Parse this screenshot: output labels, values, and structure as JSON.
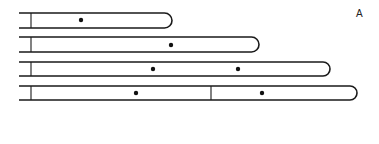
{
  "panel_label": "A",
  "colors": {
    "stroke": "#1a1a1a",
    "dot": "#111111",
    "background": "#ffffff"
  },
  "rods": [
    {
      "id": "rod-1",
      "top": 13,
      "bottom": 28,
      "left": 19,
      "pole_x": 31,
      "end_x": 172,
      "dividers": [],
      "dots": [
        {
          "x": 81,
          "y": 20
        }
      ]
    },
    {
      "id": "rod-2",
      "top": 37,
      "bottom": 52,
      "left": 19,
      "pole_x": 31,
      "end_x": 259,
      "dividers": [],
      "dots": [
        {
          "x": 171,
          "y": 45
        }
      ]
    },
    {
      "id": "rod-3",
      "top": 62,
      "bottom": 76,
      "left": 19,
      "pole_x": 31,
      "end_x": 330,
      "dividers": [],
      "dots": [
        {
          "x": 153,
          "y": 69
        },
        {
          "x": 238,
          "y": 69
        }
      ]
    },
    {
      "id": "rod-4",
      "top": 86,
      "bottom": 100,
      "left": 19,
      "pole_x": 31,
      "end_x": 357,
      "dividers": [
        211
      ],
      "dots": [
        {
          "x": 136,
          "y": 93
        },
        {
          "x": 262,
          "y": 93
        }
      ]
    }
  ]
}
